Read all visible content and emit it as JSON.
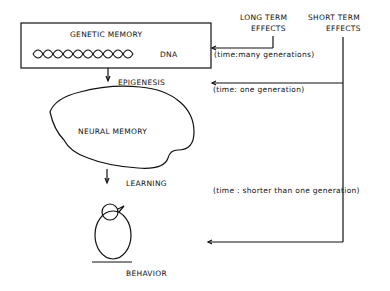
{
  "genetic_box": {
    "title": "GENETIC    MEMORY",
    "dna_label": "DNA"
  },
  "effects": {
    "long_term": [
      "LONG TERM",
      "EFFECTS"
    ],
    "short_term": [
      "SHORT TERM",
      "EFFECTS"
    ]
  },
  "stages": {
    "epigenesis": "EPIGENESIS",
    "neural_memory": "NEURAL MEMORY",
    "learning": "LEARNING",
    "behavior": "BEHAVIOR"
  },
  "timescales": {
    "many": "(time:many generations)",
    "one": "(time: one generation)",
    "shorter": "(time : shorter than one generation)"
  }
}
